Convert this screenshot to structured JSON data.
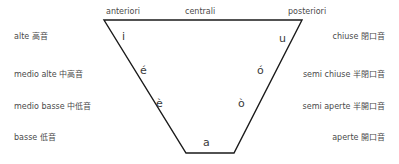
{
  "diagram": {
    "stroke_color": "#1a1a1a",
    "text_color": "#4a4a4a",
    "background": "#ffffff",
    "top_axis": [
      {
        "label": "anteriori",
        "x": 106,
        "y": 8
      },
      {
        "label": "centrali",
        "x": 185,
        "y": 8
      },
      {
        "label": "posteriori",
        "x": 288,
        "y": 8
      }
    ],
    "left_labels": [
      {
        "label": "alte 高音",
        "y": 33
      },
      {
        "label": "medio alte 中高音",
        "y": 71
      },
      {
        "label": "medio basse 中低音",
        "y": 103
      },
      {
        "label": "basse 低音",
        "y": 134
      }
    ],
    "right_labels": [
      {
        "label": "chiuse 閉口音",
        "y": 33
      },
      {
        "label": "semi chiuse 半閉口音",
        "y": 71
      },
      {
        "label": "semi aperte 半開口音",
        "y": 103
      },
      {
        "label": "aperte 開口音",
        "y": 134
      }
    ],
    "vowels": [
      {
        "glyph": "i",
        "x": 122,
        "y": 31,
        "name": "vowel-i"
      },
      {
        "glyph": "u",
        "x": 279,
        "y": 33,
        "name": "vowel-u"
      },
      {
        "glyph": "é",
        "x": 140,
        "y": 65,
        "name": "vowel-e-acute"
      },
      {
        "glyph": "ó",
        "x": 257,
        "y": 65,
        "name": "vowel-o-acute"
      },
      {
        "glyph": "è",
        "x": 156,
        "y": 98,
        "name": "vowel-e-grave"
      },
      {
        "glyph": "ò",
        "x": 238,
        "y": 98,
        "name": "vowel-o-grave"
      },
      {
        "glyph": "a",
        "x": 203,
        "y": 137,
        "name": "vowel-a"
      }
    ],
    "trapezoid": {
      "points": "104,20 302,20 234,153 186,153",
      "stroke_width": 1.4
    }
  }
}
